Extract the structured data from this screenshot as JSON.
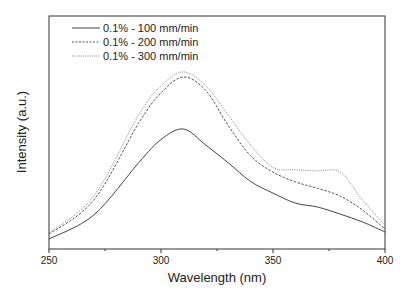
{
  "chart_data": {
    "type": "line",
    "title": "",
    "xlabel": "Wavelength (nm)",
    "ylabel": "Intensity (a.u.)",
    "xlim": [
      250,
      400
    ],
    "ylim": [
      0,
      100
    ],
    "x_ticks": [
      250,
      300,
      350,
      400
    ],
    "y_ticks": [],
    "grid": false,
    "legend_position": "upper left",
    "x": [
      250,
      270,
      290,
      300,
      310,
      320,
      330,
      340,
      350,
      360,
      370,
      380,
      390,
      400
    ],
    "series": [
      {
        "name": "0.1% - 100 mm/min",
        "style": "solid",
        "color": "#444444",
        "values": [
          4.3,
          14.6,
          37,
          47,
          51.5,
          44.6,
          37,
          29,
          24,
          19.7,
          18,
          15,
          11.6,
          7.3
        ]
      },
      {
        "name": "0.1% - 200 mm/min",
        "style": "dashed",
        "color": "#555555",
        "values": [
          6.4,
          21,
          54,
          67,
          73.8,
          68,
          53,
          40,
          33,
          28.8,
          26,
          22.7,
          16.7,
          8.6
        ]
      },
      {
        "name": "0.1% - 300 mm/min",
        "style": "dotted",
        "color": "#888888",
        "values": [
          6.9,
          22.7,
          57.5,
          70,
          76,
          70,
          57.5,
          44.6,
          35,
          34,
          33.5,
          33,
          21,
          10.3
        ]
      }
    ]
  },
  "legend": {
    "items": [
      "0.1% - 100 mm/min",
      "0.1% - 200 mm/min",
      "0.1% - 300 mm/min"
    ]
  },
  "axes": {
    "xlabel": "Wavelength (nm)",
    "ylabel": "Intensity (a.u.)",
    "x_tick_labels": [
      "250",
      "300",
      "350",
      "400"
    ]
  }
}
